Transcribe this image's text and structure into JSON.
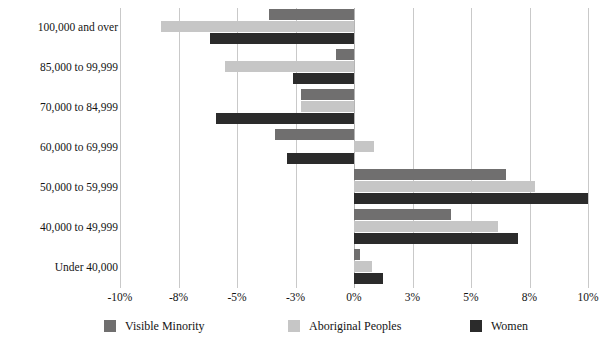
{
  "chart_data": {
    "type": "bar",
    "orientation": "horizontal",
    "title": "",
    "subtitle": "",
    "xlabel": "",
    "ylabel": "",
    "grid": true,
    "legend_position": "bottom",
    "axis_note": "category-spaced tick positions, not linear",
    "xticks": [
      "-10%",
      "-8%",
      "-5%",
      "-3%",
      "0%",
      "3%",
      "5%",
      "8%",
      "10%"
    ],
    "xtick_values": [
      -10,
      -8,
      -5,
      -3,
      0,
      3,
      5,
      8,
      10
    ],
    "xlim": [
      -10,
      10
    ],
    "categories": [
      "100,000 and over",
      "85,000 to 99,999",
      "70,000 to 84,999",
      "60,000 to 69,999",
      "50,000 to 59,999",
      "40,000 to 49,999",
      "Under 40,000"
    ],
    "series": [
      {
        "name": "Visible Minority",
        "color": "#706f6f",
        "values": [
          -3.9,
          -0.9,
          -2.7,
          -3.7,
          6.8,
          4.3,
          0.3
        ]
      },
      {
        "name": "Aboriginal Peoples",
        "color": "#c6c6c6",
        "values": [
          -8.6,
          -5.6,
          -2.7,
          1.0,
          8.2,
          6.4,
          0.9
        ]
      },
      {
        "name": "Women",
        "color": "#2b2b2b",
        "values": [
          -6.4,
          -3.1,
          -6.1,
          -3.3,
          10.0,
          7.4,
          1.5
        ]
      }
    ]
  },
  "legend": {
    "items": [
      {
        "label": "Visible Minority",
        "color": "#706f6f"
      },
      {
        "label": "Aboriginal Peoples",
        "color": "#c6c6c6"
      },
      {
        "label": "Women",
        "color": "#2b2b2b"
      }
    ]
  },
  "colors": {
    "visible_minority": "#706f6f",
    "aboriginal_peoples": "#c6c6c6",
    "women": "#2b2b2b",
    "gridline": "#c9c9c9",
    "zeroline": "#b4b4b4",
    "text": "#141414",
    "background": "#ffffff"
  }
}
